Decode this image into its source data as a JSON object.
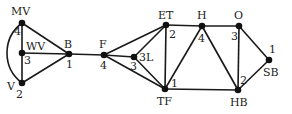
{
  "graph": {
    "nodes": [
      {
        "id": "MV",
        "label": "MV",
        "degree": "4",
        "x": 22,
        "y": 23
      },
      {
        "id": "WV",
        "label": "WV",
        "degree": "3",
        "x": 22,
        "y": 53
      },
      {
        "id": "V",
        "label": "V",
        "degree": "2",
        "x": 22,
        "y": 83
      },
      {
        "id": "B",
        "label": "B",
        "degree": "1",
        "x": 69,
        "y": 54
      },
      {
        "id": "F",
        "label": "F",
        "degree": "4",
        "x": 104,
        "y": 55
      },
      {
        "id": "3L",
        "label": "3L",
        "degree": "3",
        "x": 134,
        "y": 57
      },
      {
        "id": "ET",
        "label": "ET",
        "degree": "2",
        "x": 166,
        "y": 25
      },
      {
        "id": "TF",
        "label": "TF",
        "degree": "1",
        "x": 165,
        "y": 89
      },
      {
        "id": "H",
        "label": "H",
        "degree": "4",
        "x": 202,
        "y": 26
      },
      {
        "id": "O",
        "label": "O",
        "degree": "3",
        "x": 239,
        "y": 26
      },
      {
        "id": "HB",
        "label": "HB",
        "degree": "2",
        "x": 238,
        "y": 90
      },
      {
        "id": "SB",
        "label": "SB",
        "degree": "1",
        "x": 269,
        "y": 60
      }
    ],
    "edges": [
      [
        "MV",
        "WV"
      ],
      [
        "WV",
        "V"
      ],
      [
        "MV",
        "V"
      ],
      [
        "MV",
        "B"
      ],
      [
        "WV",
        "B"
      ],
      [
        "V",
        "B"
      ],
      [
        "B",
        "F"
      ],
      [
        "F",
        "ET"
      ],
      [
        "F",
        "3L"
      ],
      [
        "F",
        "TF"
      ],
      [
        "3L",
        "ET"
      ],
      [
        "3L",
        "TF"
      ],
      [
        "ET",
        "TF"
      ],
      [
        "ET",
        "H"
      ],
      [
        "TF",
        "H"
      ],
      [
        "TF",
        "HB"
      ],
      [
        "H",
        "O"
      ],
      [
        "H",
        "HB"
      ],
      [
        "O",
        "HB"
      ],
      [
        "O",
        "SB"
      ],
      [
        "HB",
        "SB"
      ]
    ],
    "curved_edges": [
      [
        "MV",
        "V"
      ]
    ]
  },
  "labels": {
    "MV": "MV",
    "WV": "WV",
    "V": "V",
    "B": "B",
    "F": "F",
    "3L": "3L",
    "ET": "ET",
    "TF": "TF",
    "H": "H",
    "O": "O",
    "HB": "HB",
    "SB": "SB"
  },
  "degrees": {
    "MV": "4",
    "WV": "3",
    "V": "2",
    "B": "1",
    "F": "4",
    "3L": "3",
    "ET": "2",
    "TF": "1",
    "H": "4",
    "O": "3",
    "HB": "2",
    "SB": "1"
  }
}
